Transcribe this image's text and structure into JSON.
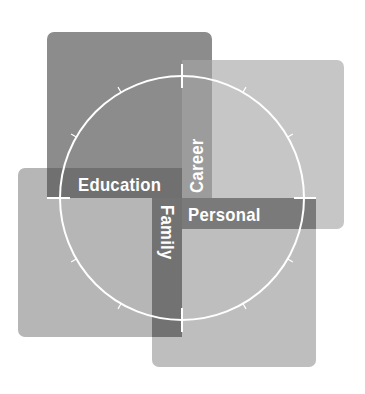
{
  "diagram": {
    "title": "",
    "quadrants": [
      {
        "id": "education",
        "label": "Education",
        "position": "top-left",
        "color": "#8c8c8c"
      },
      {
        "id": "career",
        "label": "Career",
        "position": "top-right",
        "color": "#c6c6c6"
      },
      {
        "id": "family",
        "label": "Family",
        "position": "bottom-left",
        "color": "#b6b6b6"
      },
      {
        "id": "personal",
        "label": "Personal",
        "position": "bottom-right",
        "color": "#bebebe"
      }
    ],
    "labels": {
      "education": "Education",
      "career": "Career",
      "family": "Family",
      "personal": "Personal"
    },
    "bar_color": "#707070",
    "circle": {
      "stroke": "#ffffff",
      "ticks_per_quadrant": 3
    }
  }
}
